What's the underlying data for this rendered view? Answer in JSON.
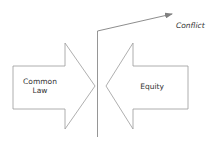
{
  "diagram": {
    "left_arrow": {
      "label_line1": "Common",
      "label_line2": "Law",
      "direction": "right"
    },
    "right_arrow": {
      "label": "Equity",
      "direction": "left"
    },
    "outcome": {
      "label": "Conflict",
      "direction": "up-right"
    },
    "colors": {
      "stroke": "#8a8a8a",
      "fill": "#ffffff",
      "text": "#333333"
    }
  }
}
